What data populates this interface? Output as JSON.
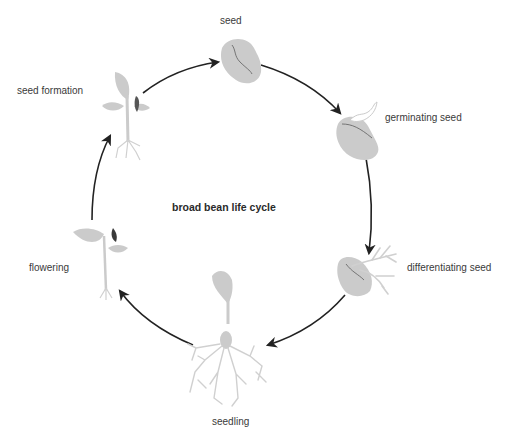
{
  "diagram": {
    "title": "broad bean life cycle",
    "type": "cycle",
    "stages": [
      {
        "label": "seed"
      },
      {
        "label": "germinating seed"
      },
      {
        "label": "differentiating seed"
      },
      {
        "label": "seedling"
      },
      {
        "label": "flowering"
      },
      {
        "label": "seed formation"
      }
    ],
    "colors": {
      "illustration": "#c8c8c8",
      "arrow": "#222222",
      "accent": "#555555"
    }
  }
}
